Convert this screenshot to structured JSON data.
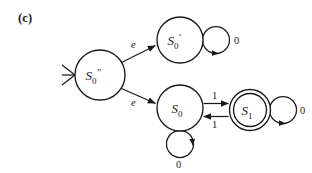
{
  "figure": {
    "label": "(c)",
    "background_color": "#ffffff",
    "ink_color": "#1a1a1a"
  },
  "diagram": {
    "type": "finite-state-automaton",
    "start_marker": ">",
    "states": [
      {
        "id": "s0dprime",
        "base": "S",
        "subscript": "0",
        "prime": "″",
        "accepting": false,
        "start": true,
        "cx": 100,
        "cy": 75,
        "r": 25
      },
      {
        "id": "s0prime",
        "base": "S",
        "subscript": "0",
        "prime": "′",
        "accepting": false,
        "start": false,
        "cx": 180,
        "cy": 40,
        "r": 23
      },
      {
        "id": "s0",
        "base": "S",
        "subscript": "0",
        "prime": "",
        "accepting": false,
        "start": false,
        "cx": 180,
        "cy": 108,
        "r": 23
      },
      {
        "id": "s1",
        "base": "S",
        "subscript": "1",
        "prime": "",
        "accepting": true,
        "start": false,
        "cx": 250,
        "cy": 110,
        "r": 20
      }
    ],
    "transitions": [
      {
        "id": "t-eps-upper",
        "from": "s0dprime",
        "to": "s0prime",
        "label": "e",
        "kind": "epsilon"
      },
      {
        "id": "t-eps-lower",
        "from": "s0dprime",
        "to": "s0",
        "label": "e",
        "kind": "epsilon"
      },
      {
        "id": "t-s0-s1",
        "from": "s0",
        "to": "s1",
        "label": "1",
        "kind": "forward"
      },
      {
        "id": "t-s1-s0",
        "from": "s1",
        "to": "s0",
        "label": "1",
        "kind": "backward"
      }
    ],
    "self_loops": [
      {
        "id": "loop-s0prime",
        "state": "s0prime",
        "label": "0",
        "position": "right"
      },
      {
        "id": "loop-s0",
        "state": "s0",
        "label": "0",
        "position": "bottom"
      },
      {
        "id": "loop-s1",
        "state": "s1",
        "label": "0",
        "position": "right"
      }
    ]
  }
}
